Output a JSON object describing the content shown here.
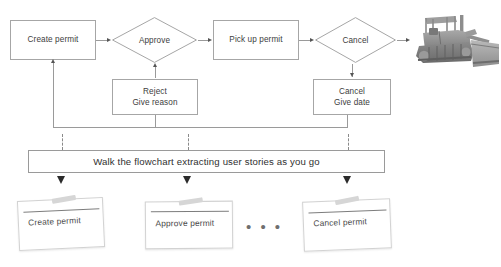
{
  "diagram": {
    "flow": {
      "create_permit": {
        "label": "Create permit"
      },
      "approve": {
        "label": "Approve"
      },
      "pick_up_permit": {
        "label": "Pick up permit"
      },
      "cancel": {
        "label": "Cancel"
      },
      "reject": {
        "line1": "Reject",
        "line2": "Give reason"
      },
      "cancel_give_date": {
        "line1": "Cancel",
        "line2": "Give date"
      },
      "end_image": {
        "alt": "bulldozer-photo"
      }
    },
    "banner": {
      "label": "Walk the flowchart extracting user stories as you go"
    },
    "cards": [
      {
        "label": "Create permit"
      },
      {
        "label": "Approve permit"
      },
      {
        "label": "Cancel permit"
      }
    ],
    "ellipsis": {
      "label": "• • •"
    },
    "colors": {
      "node_border": "#a6a6a6",
      "connector": "#9a9a9a",
      "arrow": "#555555",
      "text": "#3d3d3d",
      "banner_border": "#9a9a9a",
      "card_border": "#d2d2d2",
      "tape": "#d6d6d6",
      "fat_arrow": "#2b2b2b",
      "background": "#ffffff"
    }
  }
}
